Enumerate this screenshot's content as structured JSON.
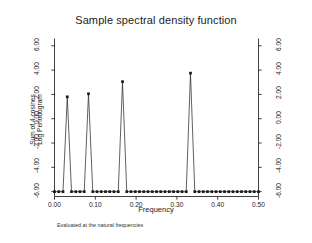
{
  "figure": {
    "title": "Sample spectral density function",
    "note": "Evaluated at the natural frequencies",
    "background": "#ffffff",
    "line_color": "#2b2b2b",
    "marker_color": "#1a1a1a"
  },
  "axes": {
    "x_label": "Frequency",
    "y_label_line1": "Sum of 4 cosines",
    "y_label_line2": "Log Periodogram",
    "x_ticks": [
      "0.00",
      "0.10",
      "0.20",
      "0.30",
      "0.40",
      "0.50"
    ],
    "x_tick_values": [
      0.0,
      0.1,
      0.2,
      0.3,
      0.4,
      0.5
    ],
    "y_ticks": [
      "6.00",
      "4.00",
      "2.00",
      "0.00",
      "-2.00",
      "-4.00",
      "-6.00"
    ],
    "y_tick_values": [
      6,
      4,
      2,
      0,
      -2,
      -4,
      -6
    ],
    "y_ticks_right": [
      "6.00",
      "4.00",
      "2.00",
      "0.00",
      "-2.00",
      "-4.00",
      "-6.00"
    ],
    "xlim": [
      0.0,
      0.5
    ],
    "ylim": [
      -6.4,
      6.6
    ],
    "grid": false
  },
  "chart_data": {
    "type": "line",
    "title": "Sample spectral density function",
    "subtitle": "Evaluated at the natural frequencies",
    "xlabel": "Frequency",
    "ylabel": "Sum of 4 cosines Log Periodogram",
    "xlim": [
      0.0,
      0.5
    ],
    "ylim": [
      -6.4,
      6.6
    ],
    "grid": false,
    "legend": "none",
    "markers": "square",
    "peaks": [
      {
        "frequency": 0.0313,
        "value": 1.8
      },
      {
        "frequency": 0.0833,
        "value": 2.05
      },
      {
        "frequency": 0.1667,
        "value": 3.05
      },
      {
        "frequency": 0.3333,
        "value": 3.75
      }
    ],
    "baseline_value": -6.0,
    "x": [
      0.0,
      0.0104,
      0.0208,
      0.0313,
      0.0417,
      0.0521,
      0.0625,
      0.0729,
      0.0833,
      0.0938,
      0.1042,
      0.1146,
      0.125,
      0.1354,
      0.1458,
      0.1563,
      0.1667,
      0.1771,
      0.1875,
      0.1979,
      0.2083,
      0.2188,
      0.2292,
      0.2396,
      0.25,
      0.2604,
      0.2708,
      0.2813,
      0.2917,
      0.3021,
      0.3125,
      0.3229,
      0.3333,
      0.3438,
      0.3542,
      0.3646,
      0.375,
      0.3854,
      0.3958,
      0.4063,
      0.4167,
      0.4271,
      0.4375,
      0.4479,
      0.4583,
      0.4688,
      0.4792,
      0.4896,
      0.5
    ],
    "y": [
      -6.0,
      -6.0,
      -6.0,
      1.8,
      -6.0,
      -6.0,
      -6.0,
      -6.0,
      2.05,
      -6.0,
      -6.0,
      -6.0,
      -6.0,
      -6.0,
      -6.0,
      -6.0,
      3.05,
      -6.0,
      -6.0,
      -6.0,
      -6.0,
      -6.0,
      -6.0,
      -6.0,
      -6.0,
      -6.0,
      -6.0,
      -6.0,
      -6.0,
      -6.0,
      -6.0,
      -6.0,
      3.75,
      -6.0,
      -6.0,
      -6.0,
      -6.0,
      -6.0,
      -6.0,
      -6.0,
      -6.0,
      -6.0,
      -6.0,
      -6.0,
      -6.0,
      -6.0,
      -6.0,
      -6.0,
      -6.0
    ]
  }
}
